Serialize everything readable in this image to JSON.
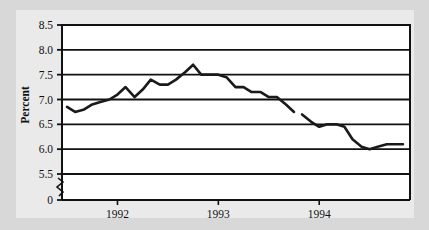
{
  "figure": {
    "background_color": "#d8d8d8",
    "panel_color": "#eaeaea",
    "plot_background": "#ffffff",
    "axis_color": "#111111",
    "line_color": "#1a1a1a"
  },
  "chart_data": {
    "type": "line",
    "title": "",
    "xlabel": "",
    "ylabel": "Percent",
    "ylim": [
      5.25,
      8.5
    ],
    "ytick_labels": [
      "8.5",
      "8.0",
      "7.5",
      "7.0",
      "6.5",
      "6.0",
      "5.5",
      "0"
    ],
    "ytick_values": [
      8.5,
      8.0,
      7.5,
      7.0,
      6.5,
      6.0,
      5.5,
      0
    ],
    "y_axis_break": true,
    "y_axis_break_note": "axis break between 5.5 and 0",
    "grid": true,
    "grid_orientation": "horizontal",
    "legend": "none",
    "xlim": [
      1991.45,
      1994.9
    ],
    "xtick_labels": [
      "1992",
      "1993",
      "1994"
    ],
    "xtick_values": [
      1992,
      1993,
      1994
    ],
    "series": [
      {
        "name": "Unemployment rate",
        "x": [
          1991.5,
          1991.58,
          1991.67,
          1991.75,
          1991.83,
          1991.92,
          1992.0,
          1992.08,
          1992.17,
          1992.25,
          1992.33,
          1992.42,
          1992.5,
          1992.58,
          1992.67,
          1992.75,
          1992.83,
          1992.92,
          1993.0,
          1993.08,
          1993.17,
          1993.25,
          1993.33,
          1993.42,
          1993.5,
          1993.58,
          1993.67,
          1993.75
        ],
        "values": [
          6.85,
          6.75,
          6.8,
          6.9,
          6.95,
          7.0,
          7.1,
          7.25,
          7.05,
          7.2,
          7.4,
          7.3,
          7.3,
          7.4,
          7.55,
          7.7,
          7.5,
          7.5,
          7.5,
          7.45,
          7.25,
          7.25,
          7.15,
          7.15,
          7.05,
          7.05,
          6.9,
          6.75
        ],
        "segment": "first"
      },
      {
        "name": "Unemployment rate (revised series)",
        "x": [
          1993.83,
          1993.92,
          1994.0,
          1994.08,
          1994.17,
          1994.25,
          1994.33,
          1994.42,
          1994.5,
          1994.58,
          1994.67,
          1994.83
        ],
        "values": [
          6.7,
          6.55,
          6.45,
          6.5,
          6.5,
          6.45,
          6.2,
          6.05,
          6.0,
          6.05,
          6.1,
          6.1
        ],
        "segment": "second"
      }
    ]
  }
}
